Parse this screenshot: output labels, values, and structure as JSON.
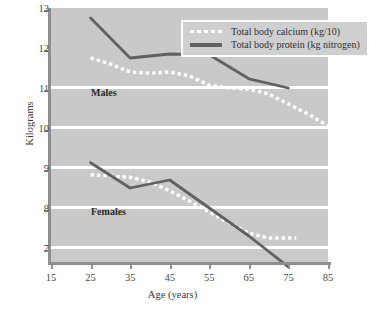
{
  "chart_data": {
    "type": "line",
    "title": "",
    "xlabel": "Age (years)",
    "ylabel": "Kilograms",
    "xlim": [
      15,
      85
    ],
    "ylim": [
      6.5,
      13
    ],
    "xticks": [
      15,
      25,
      35,
      45,
      55,
      65,
      75,
      85
    ],
    "yticks": [
      7,
      8,
      9,
      10,
      11,
      12,
      13
    ],
    "grid": "horizontal",
    "legend_position": "top-right-inside",
    "plot_background": "#c9c9c9",
    "colors": {
      "calcium": "#ffffff",
      "protein": "#616161",
      "axis": "#8e8e8e",
      "gridline": "#ffffff"
    },
    "annotations": [
      {
        "text": "Males",
        "x": 27,
        "y": 11.15
      },
      {
        "text": "Females",
        "x": 27,
        "y": 8.25
      }
    ],
    "series": [
      {
        "name": "Total body calcium (kg/10)",
        "group": "Males",
        "style": "dotted",
        "color": "#ffffff",
        "x": [
          25,
          30,
          35,
          40,
          45,
          50,
          55,
          60,
          65,
          70,
          75,
          80,
          85
        ],
        "values": [
          11.8,
          11.65,
          11.45,
          11.42,
          11.45,
          11.35,
          11.12,
          11.05,
          11.02,
          10.9,
          10.65,
          10.4,
          10.1
        ]
      },
      {
        "name": "Total body protein (kg nitrogen)",
        "group": "Males",
        "style": "solid",
        "color": "#616161",
        "x": [
          25,
          35,
          45,
          55,
          65,
          75
        ],
        "values": [
          12.8,
          11.8,
          11.9,
          11.88,
          11.28,
          11.05
        ]
      },
      {
        "name": "Total body calcium (kg/10)",
        "group": "Females",
        "style": "dotted",
        "color": "#ffffff",
        "x": [
          25,
          30,
          35,
          40,
          45,
          50,
          55,
          60,
          65,
          70,
          77
        ],
        "values": [
          8.88,
          8.85,
          8.82,
          8.7,
          8.48,
          8.22,
          7.95,
          7.68,
          7.42,
          7.3,
          7.3
        ]
      },
      {
        "name": "Total body protein (kg nitrogen)",
        "group": "Females",
        "style": "solid",
        "color": "#616161",
        "x": [
          25,
          35,
          45,
          55,
          65,
          75
        ],
        "values": [
          9.18,
          8.55,
          8.75,
          8.05,
          7.35,
          6.58
        ]
      }
    ]
  },
  "axes": {
    "y_title": "Kilograms",
    "x_title": "Age (years)",
    "y_labels": [
      "13",
      "12",
      "11",
      "10",
      "9",
      "8",
      "7"
    ],
    "x_labels": [
      "15",
      "25",
      "35",
      "45",
      "55",
      "65",
      "75",
      "85"
    ]
  },
  "legend": {
    "items": [
      {
        "label": "Total body calcium (kg/10)",
        "style": "dotted"
      },
      {
        "label": "Total body protein (kg nitrogen)",
        "style": "solid"
      }
    ]
  },
  "annotations": {
    "males": "Males",
    "females": "Females"
  }
}
